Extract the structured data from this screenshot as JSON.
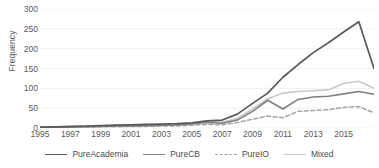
{
  "chart_data": {
    "type": "line",
    "title": "",
    "xlabel": "",
    "ylabel": "Frequency",
    "ylim": [
      0,
      300
    ],
    "yticks": [
      0,
      50,
      100,
      150,
      200,
      250,
      300
    ],
    "xlim": [
      1995,
      2017
    ],
    "xticks": [
      1995,
      1997,
      1999,
      2001,
      2003,
      2005,
      2007,
      2009,
      2011,
      2013,
      2015
    ],
    "x": [
      1995,
      1996,
      1997,
      1998,
      1999,
      2000,
      2001,
      2002,
      2003,
      2004,
      2005,
      2006,
      2007,
      2008,
      2009,
      2010,
      2011,
      2012,
      2013,
      2014,
      2015,
      2016,
      2017
    ],
    "grid": "horizontal",
    "legend_position": "bottom",
    "series": [
      {
        "name": "PureAcademia",
        "color": "#595959",
        "style": "solid",
        "width": 1.7,
        "values": [
          2,
          3,
          4,
          5,
          6,
          7,
          8,
          9,
          10,
          11,
          13,
          18,
          20,
          35,
          62,
          88,
          128,
          160,
          190,
          215,
          242,
          268,
          150
        ]
      },
      {
        "name": "PureCB",
        "color": "#7f7f7f",
        "style": "solid",
        "width": 1.6,
        "values": [
          1,
          2,
          2,
          3,
          4,
          5,
          5,
          6,
          7,
          8,
          10,
          14,
          12,
          20,
          42,
          70,
          48,
          72,
          78,
          80,
          86,
          92,
          85
        ]
      },
      {
        "name": "PureIO",
        "color": "#a6a6a6",
        "style": "dashed",
        "width": 1.5,
        "values": [
          1,
          1,
          2,
          2,
          3,
          3,
          4,
          4,
          5,
          5,
          7,
          9,
          8,
          14,
          22,
          30,
          26,
          42,
          44,
          46,
          52,
          54,
          38
        ]
      },
      {
        "name": "Mixed",
        "color": "#c9c9c9",
        "style": "solid",
        "width": 1.6,
        "values": [
          1,
          2,
          3,
          4,
          5,
          6,
          7,
          8,
          9,
          10,
          12,
          16,
          15,
          24,
          48,
          74,
          88,
          92,
          94,
          96,
          112,
          118,
          100
        ]
      }
    ]
  },
  "axis": {
    "ytick_labels": [
      "300",
      "250",
      "200",
      "150",
      "100",
      "50",
      "0"
    ],
    "xtick_labels": [
      "1995",
      "1997",
      "1999",
      "2001",
      "2003",
      "2005",
      "2007",
      "2009",
      "2011",
      "2013",
      "2015"
    ],
    "ylabel_title": "Frequency"
  },
  "legend": {
    "items": [
      {
        "label": "PureAcademia",
        "color": "#595959",
        "style": "solid"
      },
      {
        "label": "PureCB",
        "color": "#7f7f7f",
        "style": "solid"
      },
      {
        "label": "PureIO",
        "color": "#a6a6a6",
        "style": "dashed"
      },
      {
        "label": "Mixed",
        "color": "#c9c9c9",
        "style": "solid"
      }
    ]
  },
  "colors": {
    "gridline": "#f0f0f0",
    "axis_text": "#595959",
    "background": "#ffffff"
  }
}
